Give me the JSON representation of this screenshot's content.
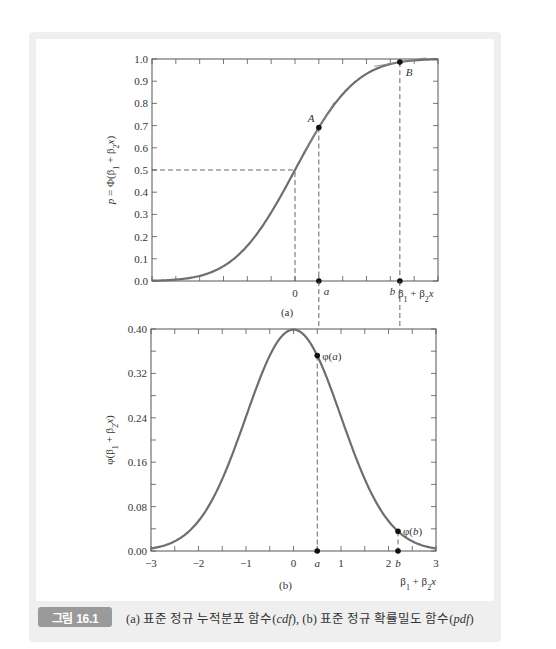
{
  "figure": {
    "label": "그림 16.1",
    "caption_parts": [
      {
        "text": "(a) 표준 정규 누적분포 함수(",
        "italic": false
      },
      {
        "text": "cdf",
        "italic": true
      },
      {
        "text": "), (b) 표준 정규 확률밀도 함수(",
        "italic": false
      },
      {
        "text": "pdf",
        "italic": true
      },
      {
        "text": ")",
        "italic": false
      }
    ],
    "colors": {
      "frame": "#efefef",
      "badge": "#9a9a9a",
      "curve": "#6e6e6e",
      "axis": "#555555",
      "text": "#333333"
    }
  },
  "chart_data": [
    {
      "type": "line",
      "panel_label": "(a)",
      "title": "Standard normal cumulative distribution function (cdf)",
      "xlabel": "β1 + β2x",
      "ylabel": "p = Φ(β1 + β2x)",
      "xlim": [
        -3,
        3
      ],
      "ylim": [
        0,
        1
      ],
      "x_tick_step": 0.5,
      "x_tick_labels": [
        {
          "x": 0,
          "label": "0"
        }
      ],
      "y_ticks": [
        0.0,
        0.1,
        0.2,
        0.3,
        0.4,
        0.5,
        0.6,
        0.7,
        0.8,
        0.9,
        1.0
      ],
      "y_tick_labels": [
        "0.0",
        "0.1",
        "0.2",
        "0.3",
        "0.4",
        "0.5",
        "0.6",
        "0.7",
        "0.8",
        "0.9",
        "1.0"
      ],
      "series": [
        {
          "name": "Φ(z)",
          "function": "normal_cdf",
          "x": [
            -3,
            -2.5,
            -2,
            -1.5,
            -1,
            -0.5,
            0,
            0.5,
            1,
            1.5,
            2,
            2.5,
            3
          ],
          "y": [
            0.001,
            0.006,
            0.023,
            0.067,
            0.159,
            0.309,
            0.5,
            0.691,
            0.841,
            0.933,
            0.977,
            0.994,
            0.999
          ]
        }
      ],
      "points": [
        {
          "name": "A",
          "x": 0.5,
          "y": 0.69,
          "marker_label": "a",
          "tangent": true
        },
        {
          "name": "B",
          "x": 2.2,
          "y": 0.986,
          "marker_label": "b",
          "tangent": true
        }
      ],
      "reference_lines": [
        {
          "type": "h",
          "y": 0.5,
          "from_x": -3,
          "to_x": 0,
          "style": "dashed"
        },
        {
          "type": "v",
          "x": 0,
          "from_y": 0,
          "to_y": 0.5,
          "style": "dashed"
        }
      ],
      "grid": false,
      "legend": null
    },
    {
      "type": "line",
      "panel_label": "(b)",
      "title": "Standard normal probability density function (pdf)",
      "xlabel": "β1 + β2x",
      "ylabel": "φ(β1 + β2x)",
      "xlim": [
        -3,
        3
      ],
      "ylim": [
        0,
        0.4
      ],
      "x_tick_step": 0.5,
      "x_tick_labels": [
        {
          "x": -3,
          "label": "−3"
        },
        {
          "x": -2,
          "label": "−2"
        },
        {
          "x": -1,
          "label": "−1"
        },
        {
          "x": 0,
          "label": "0"
        },
        {
          "x": 1,
          "label": "1"
        },
        {
          "x": 2,
          "label": "2"
        },
        {
          "x": 3,
          "label": "3"
        }
      ],
      "y_ticks": [
        0,
        0.04,
        0.08,
        0.12,
        0.16,
        0.2,
        0.24,
        0.28,
        0.32,
        0.36,
        0.4
      ],
      "y_tick_labels": [
        {
          "y": 0,
          "label": "0.00"
        },
        {
          "y": 0.08,
          "label": "0.08"
        },
        {
          "y": 0.16,
          "label": "0.16"
        },
        {
          "y": 0.24,
          "label": "0.24"
        },
        {
          "y": 0.32,
          "label": "0.32"
        },
        {
          "y": 0.4,
          "label": "0.40"
        }
      ],
      "series": [
        {
          "name": "φ(z)",
          "function": "normal_pdf",
          "x": [
            -3,
            -2.5,
            -2,
            -1.5,
            -1,
            -0.5,
            0,
            0.5,
            1,
            1.5,
            2,
            2.5,
            3
          ],
          "y": [
            0.004,
            0.018,
            0.054,
            0.13,
            0.242,
            0.352,
            0.399,
            0.352,
            0.242,
            0.13,
            0.054,
            0.018,
            0.004
          ]
        }
      ],
      "points": [
        {
          "name": "φ(a)",
          "x": 0.5,
          "y": 0.352,
          "axis_label": "a"
        },
        {
          "name": "φ(b)",
          "x": 2.2,
          "y": 0.035,
          "axis_label": "b"
        }
      ],
      "grid": false,
      "legend": null
    }
  ]
}
